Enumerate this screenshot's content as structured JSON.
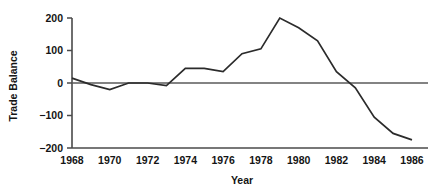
{
  "chart_data": {
    "type": "line",
    "title": "",
    "xlabel": "Year",
    "ylabel": "Trade Balance",
    "xlim": [
      1968,
      1986
    ],
    "ylim": [
      -200,
      200
    ],
    "grid": false,
    "legend": false,
    "x_ticks": [
      "1968",
      "1970",
      "1972",
      "1974",
      "1976",
      "1978",
      "1980",
      "1982",
      "1984",
      "1986"
    ],
    "x_tick_values": [
      1968,
      1970,
      1972,
      1974,
      1976,
      1978,
      1980,
      1982,
      1984,
      1986
    ],
    "y_ticks": [
      "200",
      "100",
      "0",
      "−100",
      "−200"
    ],
    "y_tick_values": [
      200,
      100,
      0,
      -100,
      -200
    ],
    "zero_reference_line": 0,
    "line_color": "#2b2b2b",
    "axis_color": "#4a4a4a",
    "x": [
      1968,
      1969,
      1970,
      1971,
      1972,
      1973,
      1974,
      1975,
      1976,
      1977,
      1978,
      1979,
      1980,
      1981,
      1982,
      1983,
      1984,
      1985,
      1986
    ],
    "series": [
      {
        "name": "Trade Balance",
        "values": [
          15,
          -5,
          -20,
          0,
          0,
          -8,
          45,
          45,
          35,
          90,
          105,
          200,
          170,
          130,
          35,
          -15,
          -105,
          -155,
          -175
        ]
      }
    ]
  }
}
